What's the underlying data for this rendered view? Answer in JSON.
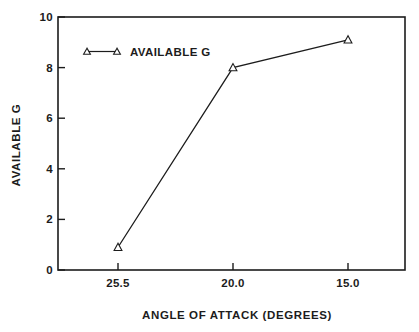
{
  "chart_data": {
    "type": "line",
    "title": "",
    "xlabel": "ANGLE OF ATTACK (DEGREES)",
    "ylabel": "AVAILABLE G",
    "categories": [
      "25.5",
      "20.0",
      "15.0"
    ],
    "series": [
      {
        "name": "AVAILABLE G",
        "values": [
          0.9,
          8.0,
          9.1
        ],
        "marker": "triangle-open",
        "color": "#1c1c1c"
      }
    ],
    "ylim": [
      0,
      10
    ],
    "yticks": [
      0,
      2,
      4,
      6,
      8,
      10
    ],
    "grid": false,
    "legend_position": "top-left",
    "axis_color": "#1c1c1c",
    "background_color": "#ffffff",
    "x_axis_direction": "decreasing"
  }
}
